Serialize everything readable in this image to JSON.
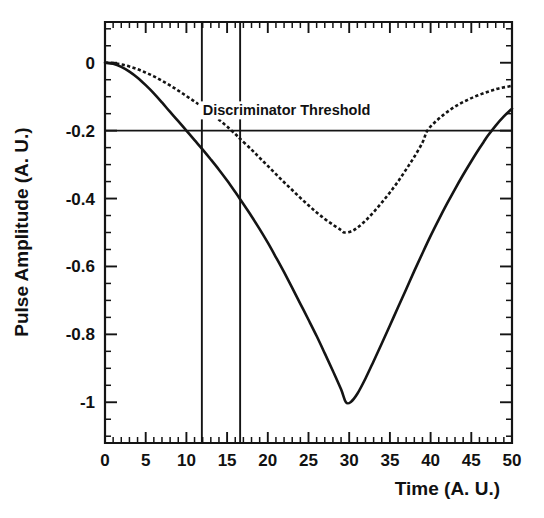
{
  "chart_data": {
    "type": "line",
    "title": "",
    "subtitle": "",
    "xlabel": "Time (A. U.)",
    "ylabel": "Pulse Amplitude (A. U.)",
    "xlim": [
      0,
      50
    ],
    "ylim": [
      -1.12,
      0.12
    ],
    "grid": false,
    "legend_position": "none",
    "x_ticks": [
      0,
      5,
      10,
      15,
      20,
      25,
      30,
      35,
      40,
      45,
      50
    ],
    "x_tick_labels": [
      "0",
      "5",
      "10",
      "15",
      "20",
      "25",
      "30",
      "35",
      "40",
      "45",
      "50"
    ],
    "x_minor_tick_step": 1,
    "y_ticks": [
      0,
      -0.2,
      -0.4,
      -0.6,
      -0.8,
      -1
    ],
    "y_tick_labels": [
      "0",
      "-0.2",
      "-0.4",
      "-0.6",
      "-0.8",
      "-1"
    ],
    "y_minor_tick_step": 0.05,
    "annotations": [
      {
        "name": "discriminator-threshold-label",
        "text": "Discriminator Threshold",
        "x": 22.3,
        "y": -0.155
      }
    ],
    "threshold": {
      "label": "Discriminator Threshold",
      "value": -0.2,
      "orientation": "horizontal",
      "x_start": 0,
      "x_end": 50
    },
    "marker_lines": [
      {
        "name": "crossing-marker-solid",
        "x": 11.9,
        "y_top": 0.12,
        "y_bottom": -1.12
      },
      {
        "name": "crossing-marker-dashed",
        "x": 16.6,
        "y_top": 0.12,
        "y_bottom": -1.12
      }
    ],
    "series": [
      {
        "name": "Large pulse",
        "style": "solid",
        "color": "#141414",
        "threshold_crossing_down": 11.9,
        "threshold_crossing_up": 46.5,
        "minimum": {
          "x": 29.6,
          "y": -1.0
        },
        "points": [
          [
            0.0,
            0.0
          ],
          [
            1.0,
            -0.003
          ],
          [
            2.0,
            -0.012
          ],
          [
            3.0,
            -0.026
          ],
          [
            4.0,
            -0.044
          ],
          [
            5.0,
            -0.066
          ],
          [
            6.0,
            -0.09
          ],
          [
            7.0,
            -0.117
          ],
          [
            8.0,
            -0.145
          ],
          [
            9.0,
            -0.172
          ],
          [
            10.0,
            -0.2
          ],
          [
            11.0,
            -0.228
          ],
          [
            11.9,
            -0.253
          ],
          [
            13.0,
            -0.285
          ],
          [
            14.0,
            -0.315
          ],
          [
            15.0,
            -0.347
          ],
          [
            16.0,
            -0.381
          ],
          [
            16.6,
            -0.402
          ],
          [
            18.0,
            -0.452
          ],
          [
            19.0,
            -0.49
          ],
          [
            20.0,
            -0.53
          ],
          [
            21.0,
            -0.573
          ],
          [
            22.0,
            -0.617
          ],
          [
            23.0,
            -0.663
          ],
          [
            24.0,
            -0.71
          ],
          [
            25.0,
            -0.757
          ],
          [
            26.0,
            -0.805
          ],
          [
            27.0,
            -0.856
          ],
          [
            28.0,
            -0.908
          ],
          [
            29.0,
            -0.962
          ],
          [
            29.6,
            -1.0
          ],
          [
            30.2,
            -0.999
          ],
          [
            31.0,
            -0.975
          ],
          [
            32.0,
            -0.93
          ],
          [
            33.0,
            -0.879
          ],
          [
            34.0,
            -0.827
          ],
          [
            35.0,
            -0.774
          ],
          [
            36.0,
            -0.72
          ],
          [
            37.0,
            -0.667
          ],
          [
            38.0,
            -0.613
          ],
          [
            39.0,
            -0.561
          ],
          [
            40.0,
            -0.51
          ],
          [
            41.0,
            -0.462
          ],
          [
            42.0,
            -0.416
          ],
          [
            43.0,
            -0.372
          ],
          [
            44.0,
            -0.33
          ],
          [
            45.0,
            -0.29
          ],
          [
            46.0,
            -0.252
          ],
          [
            46.5,
            -0.234
          ],
          [
            47.0,
            -0.216
          ],
          [
            48.0,
            -0.185
          ],
          [
            49.0,
            -0.158
          ],
          [
            50.0,
            -0.135
          ]
        ]
      },
      {
        "name": "Small pulse",
        "style": "dashed",
        "color": "#141414",
        "threshold_crossing_down": 16.6,
        "threshold_crossing_up": 39.6,
        "minimum": {
          "x": 29.4,
          "y": -0.5
        },
        "points": [
          [
            0.0,
            0.0
          ],
          [
            1.0,
            -0.001
          ],
          [
            2.0,
            -0.005
          ],
          [
            3.0,
            -0.011
          ],
          [
            4.0,
            -0.019
          ],
          [
            5.0,
            -0.029
          ],
          [
            6.0,
            -0.04
          ],
          [
            7.0,
            -0.053
          ],
          [
            8.0,
            -0.067
          ],
          [
            9.0,
            -0.082
          ],
          [
            10.0,
            -0.098
          ],
          [
            11.0,
            -0.114
          ],
          [
            11.9,
            -0.13
          ],
          [
            13.0,
            -0.15
          ],
          [
            14.0,
            -0.168
          ],
          [
            15.0,
            -0.188
          ],
          [
            16.0,
            -0.21
          ],
          [
            16.6,
            -0.224
          ],
          [
            18.0,
            -0.256
          ],
          [
            19.0,
            -0.28
          ],
          [
            20.0,
            -0.304
          ],
          [
            21.0,
            -0.328
          ],
          [
            22.0,
            -0.352
          ],
          [
            23.0,
            -0.375
          ],
          [
            24.0,
            -0.398
          ],
          [
            25.0,
            -0.42
          ],
          [
            26.0,
            -0.441
          ],
          [
            27.0,
            -0.46
          ],
          [
            28.0,
            -0.477
          ],
          [
            29.0,
            -0.493
          ],
          [
            29.4,
            -0.5
          ],
          [
            30.2,
            -0.497
          ],
          [
            31.0,
            -0.486
          ],
          [
            32.0,
            -0.465
          ],
          [
            33.0,
            -0.44
          ],
          [
            34.0,
            -0.412
          ],
          [
            35.0,
            -0.382
          ],
          [
            36.0,
            -0.35
          ],
          [
            37.0,
            -0.314
          ],
          [
            38.0,
            -0.277
          ],
          [
            39.0,
            -0.235
          ],
          [
            39.6,
            -0.2
          ],
          [
            40.5,
            -0.176
          ],
          [
            41.5,
            -0.155
          ],
          [
            42.5,
            -0.137
          ],
          [
            43.5,
            -0.122
          ],
          [
            44.5,
            -0.11
          ],
          [
            45.5,
            -0.099
          ],
          [
            46.5,
            -0.09
          ],
          [
            47.5,
            -0.082
          ],
          [
            48.5,
            -0.075
          ],
          [
            50.0,
            -0.068
          ]
        ]
      }
    ]
  },
  "figure": {
    "x_axis_title": "Time (A. U.)",
    "y_axis_title": "Pulse Amplitude (A. U.)",
    "threshold_annotation": "Discriminator Threshold"
  }
}
